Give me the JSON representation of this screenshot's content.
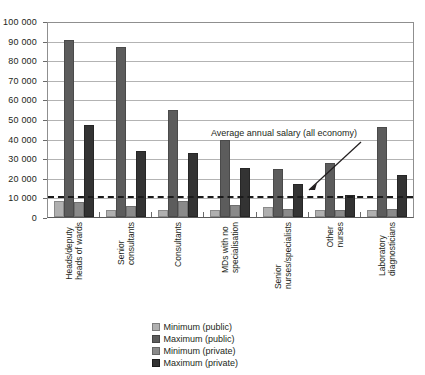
{
  "chart_data": {
    "type": "bar",
    "title": "",
    "xlabel": "",
    "ylabel": "",
    "ylim": [
      0,
      100000
    ],
    "ytick_labels": [
      "0",
      "10 000",
      "20 000",
      "30 000",
      "40 000",
      "50 000",
      "60 000",
      "70 000",
      "80 000",
      "90 000",
      "100 000"
    ],
    "ytick_values": [
      0,
      10000,
      20000,
      30000,
      40000,
      50000,
      60000,
      70000,
      80000,
      90000,
      100000
    ],
    "grid": true,
    "legend_position": "bottom-center",
    "categories": [
      "Heads/deputy heads of wards",
      "Senior consultants",
      "Consultants",
      "MDs with no specialisation",
      "Senior nurses/specialists",
      "Other nurses",
      "Laboratory diagnosticians"
    ],
    "category_lines": [
      [
        "Heads/deputy",
        "heads of wards"
      ],
      [
        "Senior",
        "consultants"
      ],
      [
        "Consultants"
      ],
      [
        "MDs with no",
        "specialisation"
      ],
      [
        "Senior",
        "nurses/specialists"
      ],
      [
        "Other",
        "nurses"
      ],
      [
        "Laboratory",
        "diagnosticians"
      ]
    ],
    "series": [
      {
        "name": "Minimum (public)",
        "key": "minpub",
        "color": "#b0b0b0",
        "values": [
          8000,
          3800,
          3600,
          3700,
          5000,
          3600,
          3800
        ]
      },
      {
        "name": "Maximum (public)",
        "key": "maxpub",
        "color": "#5c5c5c",
        "values": [
          91000,
          87000,
          55000,
          39500,
          24500,
          27500,
          46000
        ]
      },
      {
        "name": "Minimum (private)",
        "key": "minpriv",
        "color": "#8a8a8a",
        "values": [
          7500,
          5800,
          8000,
          6300,
          4000,
          3700,
          3900
        ]
      },
      {
        "name": "Maximum (private)",
        "key": "maxpriv",
        "color": "#333333",
        "values": [
          47000,
          34000,
          33000,
          25000,
          17000,
          11500,
          21500
        ]
      }
    ],
    "annotations": [
      {
        "text": "Average annual salary (all economy)",
        "value": 11000,
        "type": "reference-line-label"
      }
    ],
    "reference_line": {
      "label": "Average annual salary (all economy)",
      "value": 11000,
      "style": "dashed"
    }
  },
  "legend": {
    "items": [
      {
        "label": "Minimum (public)",
        "swatch": "minpub"
      },
      {
        "label": "Maximum (public)",
        "swatch": "maxpub"
      },
      {
        "label": "Minimum (private)",
        "swatch": "minpriv"
      },
      {
        "label": "Maximum (private)",
        "swatch": "maxpriv"
      }
    ]
  }
}
